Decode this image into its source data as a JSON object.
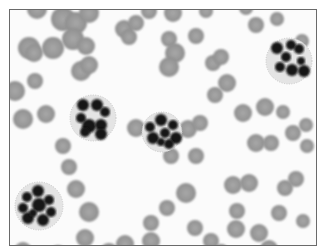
{
  "image": {
    "subject": "Blood smear micrograph (grayscale) showing neutrophils with multi-lobed nuclei among red blood cells",
    "colors": {
      "background": "#fbfbfb",
      "frame": "#6a6a6a",
      "rbc": "#8f8f8f",
      "rbc_light": "#a8a8a8",
      "nucleus": "#141414",
      "cytoplasm": "#e4e4e4"
    },
    "red_cells": [
      [
        36,
        8,
        10
      ],
      [
        62,
        18,
        12
      ],
      [
        75,
        22,
        11
      ],
      [
        72,
        38,
        11
      ],
      [
        88,
        12,
        10
      ],
      [
        28,
        47,
        11
      ],
      [
        52,
        47,
        11
      ],
      [
        33,
        52,
        9
      ],
      [
        85,
        45,
        9
      ],
      [
        80,
        70,
        10
      ],
      [
        88,
        64,
        9
      ],
      [
        34,
        80,
        8
      ],
      [
        14,
        90,
        10
      ],
      [
        22,
        118,
        10
      ],
      [
        45,
        113,
        9
      ],
      [
        123,
        28,
        9
      ],
      [
        135,
        22,
        8
      ],
      [
        128,
        36,
        8
      ],
      [
        148,
        10,
        8
      ],
      [
        172,
        12,
        9
      ],
      [
        168,
        38,
        8
      ],
      [
        174,
        52,
        10
      ],
      [
        168,
        66,
        10
      ],
      [
        195,
        35,
        8
      ],
      [
        212,
        62,
        8
      ],
      [
        220,
        56,
        8
      ],
      [
        226,
        82,
        9
      ],
      [
        214,
        94,
        8
      ],
      [
        187,
        128,
        9
      ],
      [
        199,
        122,
        8
      ],
      [
        170,
        155,
        8
      ],
      [
        195,
        155,
        8
      ],
      [
        161,
        133,
        9
      ],
      [
        135,
        127,
        9
      ],
      [
        62,
        145,
        8
      ],
      [
        68,
        166,
        8
      ],
      [
        75,
        188,
        9
      ],
      [
        88,
        211,
        10
      ],
      [
        84,
        237,
        9
      ],
      [
        124,
        243,
        9
      ],
      [
        108,
        252,
        10
      ],
      [
        57,
        253,
        9
      ],
      [
        22,
        250,
        9
      ],
      [
        242,
        112,
        9
      ],
      [
        264,
        106,
        9
      ],
      [
        282,
        111,
        7
      ],
      [
        292,
        132,
        8
      ],
      [
        305,
        124,
        7
      ],
      [
        255,
        142,
        9
      ],
      [
        270,
        142,
        8
      ],
      [
        284,
        187,
        8
      ],
      [
        295,
        178,
        8
      ],
      [
        278,
        212,
        8
      ],
      [
        302,
        220,
        7
      ],
      [
        232,
        184,
        9
      ],
      [
        248,
        182,
        9
      ],
      [
        236,
        210,
        8
      ],
      [
        235,
        228,
        9
      ],
      [
        210,
        240,
        8
      ],
      [
        220,
        251,
        8
      ],
      [
        185,
        192,
        10
      ],
      [
        166,
        207,
        8
      ],
      [
        150,
        222,
        8
      ],
      [
        150,
        240,
        9
      ],
      [
        194,
        227,
        8
      ],
      [
        258,
        232,
        9
      ],
      [
        268,
        248,
        9
      ],
      [
        306,
        145,
        7
      ],
      [
        301,
        40,
        7
      ],
      [
        276,
        18,
        7
      ],
      [
        255,
        24,
        8
      ],
      [
        245,
        7,
        7
      ],
      [
        205,
        10,
        7
      ]
    ],
    "neutrophils": [
      {
        "cx": 92,
        "cy": 117,
        "r": 23,
        "lobes": [
          [
            82,
            104,
            6
          ],
          [
            96,
            104,
            6
          ],
          [
            104,
            111,
            5
          ],
          [
            80,
            117,
            5
          ],
          [
            88,
            125,
            7
          ],
          [
            100,
            124,
            6
          ],
          [
            84,
            131,
            5
          ],
          [
            100,
            133,
            6
          ]
        ]
      },
      {
        "cx": 161,
        "cy": 131,
        "r": 20,
        "lobes": [
          [
            160,
            119,
            6
          ],
          [
            149,
            126,
            5
          ],
          [
            172,
            124,
            5
          ],
          [
            152,
            137,
            6
          ],
          [
            164,
            132,
            5
          ],
          [
            175,
            137,
            6
          ],
          [
            160,
            141,
            4
          ],
          [
            168,
            143,
            5
          ]
        ]
      },
      {
        "cx": 288,
        "cy": 60,
        "r": 23,
        "lobes": [
          [
            276,
            47,
            6
          ],
          [
            290,
            44,
            5
          ],
          [
            298,
            48,
            5
          ],
          [
            285,
            56,
            5
          ],
          [
            279,
            66,
            5
          ],
          [
            291,
            69,
            6
          ],
          [
            303,
            70,
            6
          ],
          [
            300,
            60,
            4
          ]
        ]
      },
      {
        "cx": 38,
        "cy": 205,
        "r": 24,
        "lobes": [
          [
            37,
            190,
            6
          ],
          [
            26,
            196,
            5
          ],
          [
            48,
            199,
            5
          ],
          [
            22,
            207,
            5
          ],
          [
            38,
            204,
            7
          ],
          [
            50,
            211,
            5
          ],
          [
            27,
            217,
            6
          ],
          [
            42,
            219,
            6
          ],
          [
            32,
            212,
            4
          ]
        ]
      }
    ]
  }
}
